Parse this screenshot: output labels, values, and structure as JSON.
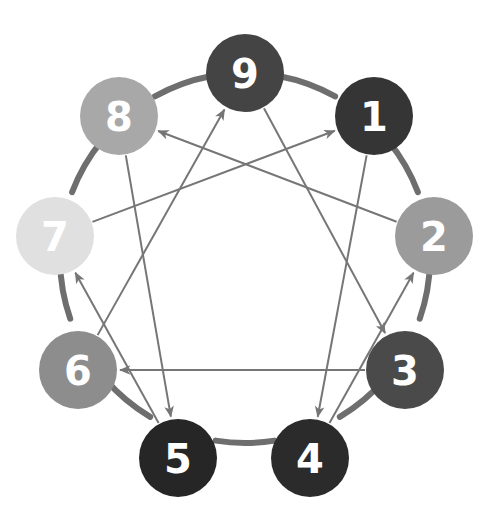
{
  "diagram": {
    "type": "enneagram-figure",
    "background_color": "#ffffff",
    "ring": {
      "stroke_color": "#6e6e6e",
      "stroke_width": 6,
      "center_x": 245,
      "center_y": 258,
      "radius": 185
    },
    "line_style": {
      "stroke_color": "#767676",
      "stroke_width": 2,
      "arrowhead": "open-triangle"
    },
    "nodes": [
      {
        "id": "node-9",
        "label": "9",
        "angle_deg": 90,
        "cx": 245,
        "cy": 73,
        "r": 39,
        "fill": "#444444",
        "text_color": "#ffffff"
      },
      {
        "id": "node-1",
        "label": "1",
        "angle_deg": 50,
        "cx": 374,
        "cy": 116,
        "r": 39,
        "fill": "#353535",
        "text_color": "#ffffff"
      },
      {
        "id": "node-2",
        "label": "2",
        "angle_deg": 10,
        "cx": 434,
        "cy": 236,
        "r": 39,
        "fill": "#9b9b9b",
        "text_color": "#ffffff"
      },
      {
        "id": "node-3",
        "label": "3",
        "angle_deg": -30,
        "cx": 405,
        "cy": 370,
        "r": 39,
        "fill": "#4a4a4a",
        "text_color": "#ffffff"
      },
      {
        "id": "node-4",
        "label": "4",
        "angle_deg": -70,
        "cx": 310,
        "cy": 458,
        "r": 39,
        "fill": "#2b2b2b",
        "text_color": "#ffffff"
      },
      {
        "id": "node-5",
        "label": "5",
        "angle_deg": -110,
        "cx": 178,
        "cy": 458,
        "r": 39,
        "fill": "#262626",
        "text_color": "#ffffff"
      },
      {
        "id": "node-6",
        "label": "6",
        "angle_deg": -150,
        "cx": 78,
        "cy": 370,
        "r": 39,
        "fill": "#8d8d8d",
        "text_color": "#ffffff"
      },
      {
        "id": "node-7",
        "label": "7",
        "angle_deg": 170,
        "cx": 55,
        "cy": 236,
        "r": 39,
        "fill": "#e0e0e0",
        "text_color": "#ffffff"
      },
      {
        "id": "node-8",
        "label": "8",
        "angle_deg": 130,
        "cx": 119,
        "cy": 116,
        "r": 39,
        "fill": "#a8a8a8",
        "text_color": "#ffffff"
      }
    ],
    "inner_triangle": {
      "name": "triangle-9-3-6",
      "sequence": [
        "9",
        "3",
        "6"
      ],
      "arrows": [
        {
          "id": "arrow-9-to-3",
          "from": "9",
          "to": "3",
          "directed": true
        },
        {
          "id": "arrow-3-to-6",
          "from": "3",
          "to": "6",
          "directed": true
        },
        {
          "id": "arrow-6-to-9",
          "from": "6",
          "to": "9",
          "directed": true
        }
      ]
    },
    "hexad": {
      "name": "hexad-1-4-2-8-5-7",
      "sequence": [
        "1",
        "4",
        "2",
        "8",
        "5",
        "7"
      ],
      "arrows": [
        {
          "id": "arrow-1-to-4",
          "from": "1",
          "to": "4",
          "directed": true
        },
        {
          "id": "arrow-4-to-2",
          "from": "4",
          "to": "2",
          "directed": true
        },
        {
          "id": "arrow-2-to-8",
          "from": "2",
          "to": "8",
          "directed": true
        },
        {
          "id": "arrow-8-to-5",
          "from": "8",
          "to": "5",
          "directed": true
        },
        {
          "id": "arrow-5-to-7",
          "from": "5",
          "to": "7",
          "directed": true
        },
        {
          "id": "arrow-7-to-1",
          "from": "7",
          "to": "1",
          "directed": true
        }
      ]
    }
  },
  "chart_data": {
    "type": "diagram",
    "categories": [
      "1",
      "2",
      "3",
      "4",
      "5",
      "6",
      "7",
      "8",
      "9"
    ],
    "node_colors": [
      "#353535",
      "#9b9b9b",
      "#4a4a4a",
      "#2b2b2b",
      "#262626",
      "#8d8d8d",
      "#e0e0e0",
      "#a8a8a8",
      "#444444"
    ],
    "edges_triangle": [
      [
        "9",
        "3"
      ],
      [
        "3",
        "6"
      ],
      [
        "6",
        "9"
      ]
    ],
    "edges_hexad": [
      [
        "1",
        "4"
      ],
      [
        "4",
        "2"
      ],
      [
        "2",
        "8"
      ],
      [
        "8",
        "5"
      ],
      [
        "5",
        "7"
      ],
      [
        "7",
        "1"
      ]
    ],
    "legend": [],
    "grid": false
  }
}
